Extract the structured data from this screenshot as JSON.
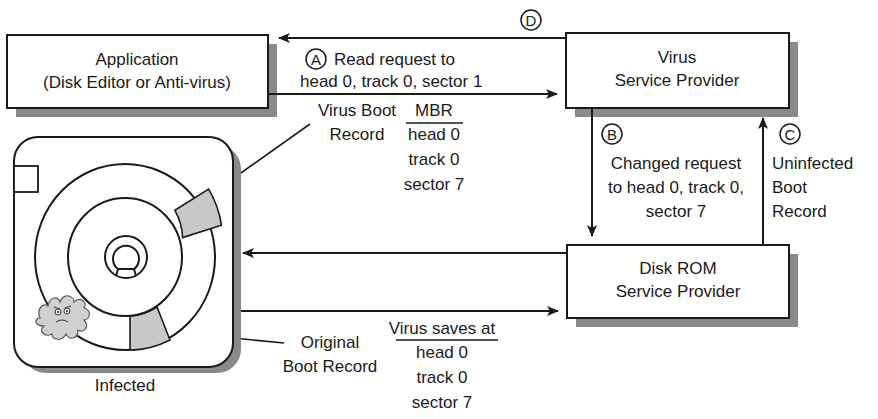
{
  "nodes": {
    "application": {
      "line1": "Application",
      "line2": "(Disk Editor or Anti-virus)"
    },
    "virus_provider": {
      "line1": "Virus",
      "line2": "Service Provider"
    },
    "disk_rom_provider": {
      "line1": "Disk ROM",
      "line2": "Service Provider"
    },
    "disk": {
      "caption": "Infected"
    }
  },
  "steps": {
    "A": {
      "marker": "A",
      "line1": "Read request to",
      "line2": "head 0, track 0, sector 1"
    },
    "B": {
      "marker": "B",
      "line1": "Changed request",
      "line2": "to head 0, track 0,",
      "line3": "sector 7"
    },
    "C": {
      "marker": "C",
      "line1": "Uninfected",
      "line2": "Boot",
      "line3": "Record"
    },
    "D": {
      "marker": "D"
    }
  },
  "annotations": {
    "virus_boot_record": {
      "line1": "Virus Boot",
      "line2": "Record"
    },
    "mbr": {
      "header": "MBR",
      "line1": "head 0",
      "line2": "track 0",
      "line3": "sector 7"
    },
    "original_boot_record": {
      "line1": "Original",
      "line2": "Boot Record"
    },
    "virus_saves": {
      "header": "Virus saves at",
      "line1": "head 0",
      "line2": "track 0",
      "line3": "sector 7"
    }
  },
  "colors": {
    "ink": "#1a1a1a",
    "shadow": "#8a8a8a",
    "sector_fill": "#c8c8c8",
    "virus_fill": "#d0d0d0"
  }
}
